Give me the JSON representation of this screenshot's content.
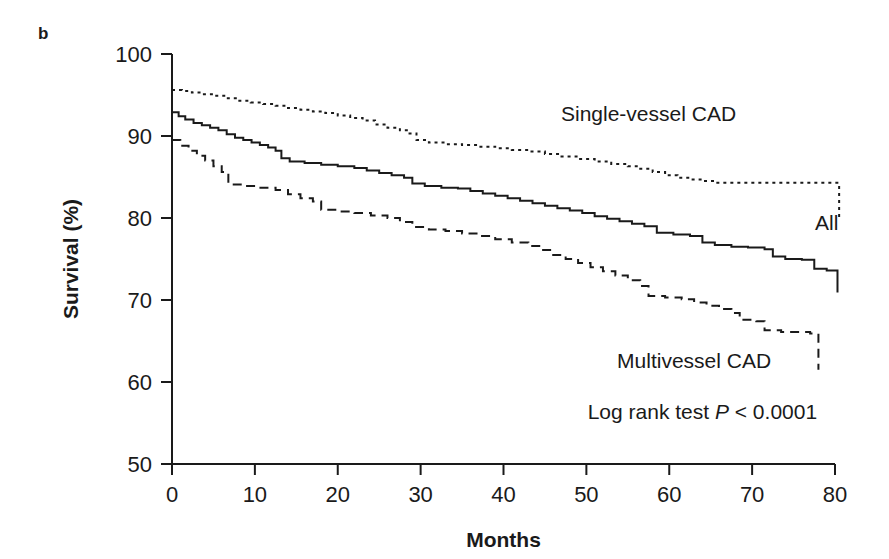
{
  "figure": {
    "panel_label": "b"
  },
  "chart_data": {
    "type": "line",
    "subtype": "kaplan-meier-survival",
    "title": "",
    "xlabel": "Months",
    "ylabel": "Survival (%)",
    "xlim": [
      0,
      80
    ],
    "ylim": [
      50,
      100
    ],
    "xticks": [
      0,
      10,
      20,
      30,
      40,
      50,
      60,
      70,
      80
    ],
    "xtick_labels": [
      "0",
      "10",
      "20",
      "30",
      "40",
      "50",
      "60",
      "70",
      "80"
    ],
    "yticks": [
      50,
      60,
      70,
      80,
      90,
      100
    ],
    "ytick_labels": [
      "50",
      "60",
      "70",
      "80",
      "90",
      "100"
    ],
    "grid": false,
    "legend_position": "inline-annotations",
    "annotations": [
      {
        "name": "single-vessel-cad-label",
        "text": "Single-vessel CAD",
        "x": 57.5,
        "y": 91.8
      },
      {
        "name": "all-label",
        "text": "All",
        "x": 79.0,
        "y": 78.5
      },
      {
        "name": "multivessel-cad-label",
        "text": "Multivessel CAD",
        "x": 63.0,
        "y": 61.7
      },
      {
        "name": "log-rank-test-label",
        "text_prefix": "Log rank test ",
        "text_italic": "P",
        "text_suffix": " < 0.0001",
        "x": 64.0,
        "y": 55.5
      }
    ],
    "series": [
      {
        "name": "Single-vessel CAD",
        "line_style": "dotted",
        "color": "#1a1a1a",
        "points": [
          [
            0,
            95.6
          ],
          [
            1.2,
            95.5
          ],
          [
            2.4,
            95.3
          ],
          [
            3.6,
            95.1
          ],
          [
            5.0,
            94.9
          ],
          [
            6.5,
            94.6
          ],
          [
            8.0,
            94.3
          ],
          [
            9.5,
            94.1
          ],
          [
            11.0,
            93.9
          ],
          [
            12.5,
            93.7
          ],
          [
            14.0,
            93.4
          ],
          [
            15.5,
            93.2
          ],
          [
            17.0,
            93.0
          ],
          [
            18.5,
            92.8
          ],
          [
            20.0,
            92.5
          ],
          [
            21.5,
            92.2
          ],
          [
            23.0,
            91.9
          ],
          [
            24.5,
            91.4
          ],
          [
            26.0,
            91.0
          ],
          [
            27.5,
            90.7
          ],
          [
            28.5,
            90.3
          ],
          [
            29.5,
            89.5
          ],
          [
            31.0,
            89.2
          ],
          [
            33.0,
            89.0
          ],
          [
            35.0,
            88.9
          ],
          [
            37.0,
            88.7
          ],
          [
            39.0,
            88.5
          ],
          [
            41.0,
            88.3
          ],
          [
            43.0,
            88.1
          ],
          [
            45.0,
            87.8
          ],
          [
            47.0,
            87.5
          ],
          [
            49.0,
            87.2
          ],
          [
            51.0,
            86.9
          ],
          [
            53.0,
            86.6
          ],
          [
            55.0,
            86.3
          ],
          [
            56.5,
            86.0
          ],
          [
            58.0,
            85.6
          ],
          [
            59.5,
            85.2
          ],
          [
            61.0,
            84.9
          ],
          [
            62.5,
            84.7
          ],
          [
            64.0,
            84.5
          ],
          [
            65.5,
            84.3
          ],
          [
            69.0,
            84.3
          ],
          [
            73.0,
            84.3
          ],
          [
            77.0,
            84.3
          ],
          [
            80.5,
            84.3
          ],
          [
            80.5,
            80.1
          ]
        ]
      },
      {
        "name": "All",
        "line_style": "solid",
        "color": "#1a1a1a",
        "points": [
          [
            0,
            92.9
          ],
          [
            0.8,
            92.4
          ],
          [
            1.6,
            92.0
          ],
          [
            2.6,
            91.6
          ],
          [
            3.6,
            91.3
          ],
          [
            4.6,
            91.0
          ],
          [
            5.6,
            90.7
          ],
          [
            6.6,
            90.2
          ],
          [
            7.6,
            89.8
          ],
          [
            8.6,
            89.5
          ],
          [
            9.6,
            89.2
          ],
          [
            10.6,
            88.9
          ],
          [
            11.6,
            88.6
          ],
          [
            12.5,
            88.2
          ],
          [
            13.2,
            87.3
          ],
          [
            14.2,
            86.9
          ],
          [
            16.0,
            86.7
          ],
          [
            18.0,
            86.5
          ],
          [
            20.0,
            86.3
          ],
          [
            22.0,
            86.1
          ],
          [
            23.5,
            85.8
          ],
          [
            25.0,
            85.5
          ],
          [
            26.5,
            85.2
          ],
          [
            28.0,
            84.9
          ],
          [
            29.0,
            84.2
          ],
          [
            30.5,
            83.9
          ],
          [
            32.5,
            83.7
          ],
          [
            34.5,
            83.6
          ],
          [
            36.0,
            83.3
          ],
          [
            37.5,
            83.0
          ],
          [
            39.0,
            82.7
          ],
          [
            40.5,
            82.4
          ],
          [
            42.0,
            82.1
          ],
          [
            43.5,
            81.8
          ],
          [
            45.0,
            81.5
          ],
          [
            46.5,
            81.2
          ],
          [
            48.0,
            80.9
          ],
          [
            49.5,
            80.6
          ],
          [
            51.0,
            80.2
          ],
          [
            52.5,
            79.9
          ],
          [
            54.0,
            79.6
          ],
          [
            55.5,
            79.3
          ],
          [
            57.0,
            79.0
          ],
          [
            58.5,
            78.2
          ],
          [
            60.5,
            78.0
          ],
          [
            62.5,
            77.8
          ],
          [
            64.0,
            77.0
          ],
          [
            65.5,
            76.7
          ],
          [
            67.5,
            76.5
          ],
          [
            69.5,
            76.4
          ],
          [
            71.5,
            76.2
          ],
          [
            72.5,
            75.3
          ],
          [
            74.0,
            75.0
          ],
          [
            76.0,
            74.9
          ],
          [
            77.5,
            73.8
          ],
          [
            79.0,
            73.6
          ],
          [
            80.3,
            73.5
          ],
          [
            80.3,
            70.9
          ]
        ]
      },
      {
        "name": "Multivessel CAD",
        "line_style": "dashed",
        "color": "#1a1a1a",
        "points": [
          [
            0,
            89.5
          ],
          [
            1.0,
            88.8
          ],
          [
            2.0,
            88.2
          ],
          [
            3.0,
            87.6
          ],
          [
            4.0,
            87.0
          ],
          [
            5.0,
            86.3
          ],
          [
            6.0,
            85.6
          ],
          [
            6.8,
            84.1
          ],
          [
            8.5,
            83.9
          ],
          [
            10.5,
            83.7
          ],
          [
            12.5,
            83.4
          ],
          [
            14.0,
            82.9
          ],
          [
            15.5,
            82.4
          ],
          [
            17.0,
            82.0
          ],
          [
            18.0,
            81.0
          ],
          [
            20.0,
            80.8
          ],
          [
            22.0,
            80.6
          ],
          [
            24.0,
            80.3
          ],
          [
            26.0,
            80.0
          ],
          [
            27.5,
            79.5
          ],
          [
            29.0,
            78.9
          ],
          [
            31.0,
            78.6
          ],
          [
            33.0,
            78.4
          ],
          [
            35.0,
            78.1
          ],
          [
            37.0,
            77.8
          ],
          [
            39.0,
            77.4
          ],
          [
            41.0,
            77.0
          ],
          [
            43.0,
            76.6
          ],
          [
            44.5,
            76.1
          ],
          [
            46.0,
            75.5
          ],
          [
            47.5,
            75.0
          ],
          [
            49.0,
            74.5
          ],
          [
            50.5,
            74.0
          ],
          [
            52.0,
            73.5
          ],
          [
            53.5,
            73.0
          ],
          [
            55.0,
            72.4
          ],
          [
            56.5,
            71.7
          ],
          [
            57.5,
            70.5
          ],
          [
            59.5,
            70.3
          ],
          [
            61.5,
            70.1
          ],
          [
            63.0,
            69.7
          ],
          [
            64.5,
            69.3
          ],
          [
            66.0,
            68.9
          ],
          [
            67.5,
            68.4
          ],
          [
            68.5,
            67.6
          ],
          [
            70.5,
            67.4
          ],
          [
            71.5,
            66.3
          ],
          [
            73.5,
            66.1
          ],
          [
            77.0,
            65.9
          ],
          [
            78.0,
            64.9
          ],
          [
            78.0,
            61.5
          ]
        ]
      }
    ]
  }
}
